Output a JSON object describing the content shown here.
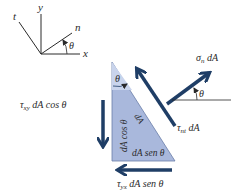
{
  "axes": {
    "t_label": "t",
    "y_label": "y",
    "n_label": "n",
    "x_label": "x",
    "theta_label": "θ"
  },
  "element": {
    "theta_label": "θ",
    "hypotenuse_label": "dA",
    "vertical_face_label": "dA cos θ",
    "bottom_face_label": "dA sen θ"
  },
  "forces": {
    "normal": {
      "symbol": "σ",
      "subscript": "n",
      "suffix": " dA",
      "angle_label": "θ"
    },
    "shear_nt": {
      "symbol": "τ",
      "subscript": "nt",
      "suffix": " dA"
    },
    "shear_xy": {
      "symbol": "τ",
      "subscript": "xy",
      "suffix": " dA cos θ"
    },
    "shear_yx": {
      "symbol": "τ",
      "subscript": "yx",
      "suffix": " dA sen θ"
    }
  },
  "colors": {
    "triangle_fill": "#a9b8dc",
    "triangle_light": "#c9d4ec",
    "arrow": "#1f3e66",
    "line": "#2a2a2a"
  }
}
